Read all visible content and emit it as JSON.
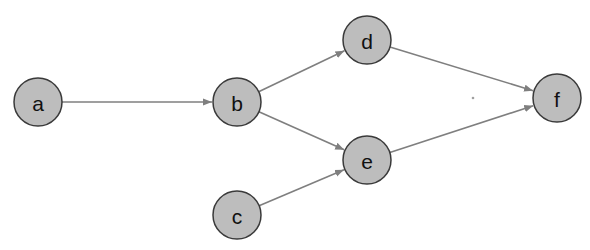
{
  "diagram": {
    "type": "directed-graph",
    "colors": {
      "node_fill": "#bdbdbd",
      "node_stroke": "#3a3a3a",
      "edge": "#7f7f7f",
      "background": "#ffffff"
    },
    "nodes": [
      {
        "id": "a",
        "label": "a",
        "x": 38,
        "y": 102
      },
      {
        "id": "b",
        "label": "b",
        "x": 237,
        "y": 102
      },
      {
        "id": "c",
        "label": "c",
        "x": 237,
        "y": 215
      },
      {
        "id": "d",
        "label": "d",
        "x": 367,
        "y": 40
      },
      {
        "id": "e",
        "label": "e",
        "x": 367,
        "y": 160
      },
      {
        "id": "f",
        "label": "f",
        "x": 557,
        "y": 98
      }
    ],
    "edges": [
      {
        "from": "a",
        "to": "b"
      },
      {
        "from": "b",
        "to": "d"
      },
      {
        "from": "b",
        "to": "e"
      },
      {
        "from": "c",
        "to": "e"
      },
      {
        "from": "d",
        "to": "f"
      },
      {
        "from": "e",
        "to": "f"
      }
    ]
  }
}
